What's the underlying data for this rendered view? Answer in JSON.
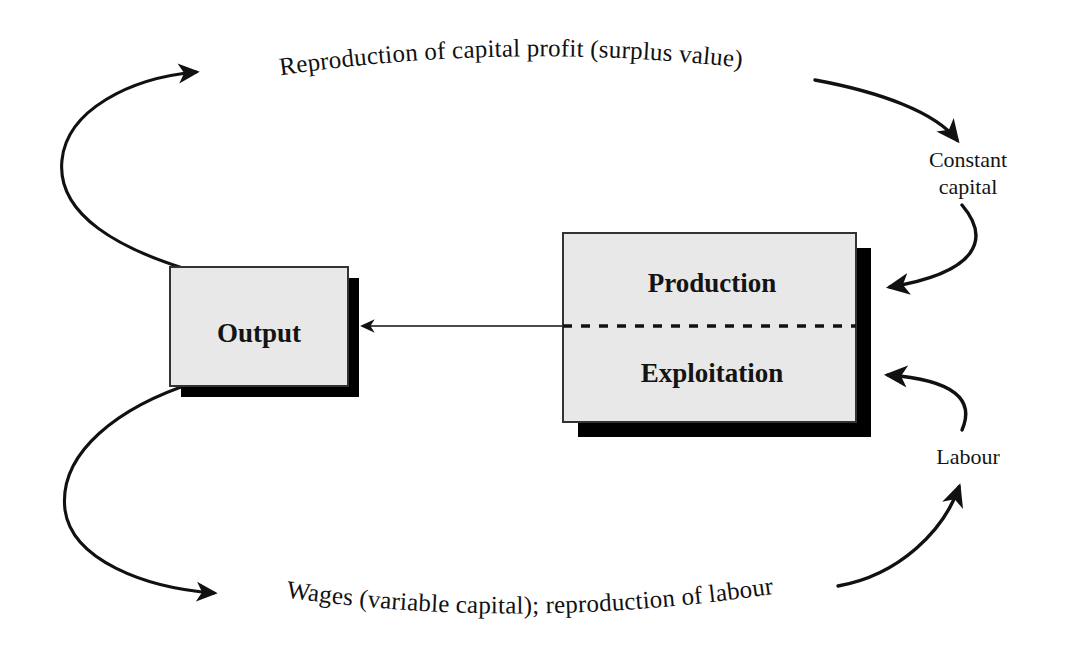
{
  "diagram": {
    "background_color": "#ffffff",
    "ink_color": "#111111",
    "box_fill_color": "#e8e8e8",
    "box_border_color": "#333333",
    "shadow_color": "#000000",
    "boxes": [
      {
        "id": "output",
        "label": "Output",
        "x": 170,
        "y": 267,
        "width": 178,
        "height": 119,
        "shadow_offset": 11
      },
      {
        "id": "production-exploitation",
        "label_top": "Production",
        "label_bottom": "Exploitation",
        "x": 563,
        "y": 233,
        "width": 293,
        "height": 189,
        "shadow_offset": 15,
        "divider": "dashed"
      }
    ],
    "side_labels": [
      {
        "id": "constant-capital",
        "lines": [
          "Constant",
          "capital"
        ],
        "x": 968,
        "y": 167
      },
      {
        "id": "labour",
        "lines": [
          "Labour"
        ],
        "x": 968,
        "y": 464
      }
    ],
    "arc_labels": [
      {
        "id": "top-arc-label",
        "text": "Reproduction of capital profit (surplus value)",
        "position": "top"
      },
      {
        "id": "bottom-arc-label",
        "text": "Wages (variable capital); reproduction of  labour",
        "position": "bottom"
      }
    ],
    "arrows": [
      {
        "id": "output-to-surplus-value",
        "from": "output",
        "to": "top-arc-label",
        "style": "curved"
      },
      {
        "id": "surplus-value-to-constant-capital",
        "from": "top-arc-label",
        "to": "constant-capital",
        "style": "curved"
      },
      {
        "id": "constant-capital-to-production",
        "from": "constant-capital",
        "to": "production-exploitation",
        "style": "curved"
      },
      {
        "id": "production-to-output",
        "from": "production-exploitation",
        "to": "output",
        "style": "straight"
      },
      {
        "id": "output-to-wages",
        "from": "output",
        "to": "bottom-arc-label",
        "style": "curved"
      },
      {
        "id": "wages-to-labour",
        "from": "bottom-arc-label",
        "to": "labour",
        "style": "curved"
      },
      {
        "id": "labour-to-exploitation",
        "from": "labour",
        "to": "production-exploitation",
        "style": "curved"
      }
    ]
  }
}
